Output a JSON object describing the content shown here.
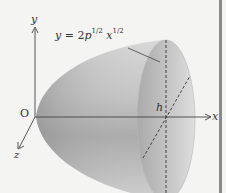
{
  "figure": {
    "type": "paraboloid-of-revolution",
    "axes": {
      "y_label": "y",
      "x_label": "x",
      "z_label": "z",
      "origin_label": "O"
    },
    "equation": {
      "lhs": "y",
      "equals": "=",
      "coef": "2",
      "p": "p",
      "p_exp": "1/2",
      "x": "x",
      "x_exp": "1/2",
      "full_text": "y = 2p^(1/2) x^(1/2)"
    },
    "height_label": "h",
    "colors": {
      "background": "#f4f4f2",
      "surface_dark": "#9a9a9a",
      "surface_light": "#e6e6e6",
      "rim_face": "#c2c2c2",
      "axis_line": "#444444",
      "right_bar": "#8a8a8a"
    }
  }
}
